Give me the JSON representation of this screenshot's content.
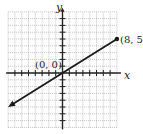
{
  "chart_data": {
    "type": "line",
    "title": "",
    "xlabel": "x",
    "ylabel": "y",
    "xlim": [
      -8,
      8
    ],
    "ylim": [
      -8,
      9
    ],
    "grid": true,
    "series": [
      {
        "name": "line through origin",
        "x": [
          -8,
          0,
          8
        ],
        "y": [
          -5,
          0,
          5
        ],
        "arrow_start": true,
        "endpoint_dot": [
          8,
          5
        ]
      }
    ],
    "annotations": [
      {
        "text": "(0, 0)",
        "x": 0,
        "y": 0
      },
      {
        "text": "(8, 5)",
        "x": 8,
        "y": 5
      }
    ]
  },
  "labels": {
    "x_axis": "x",
    "y_axis": "y",
    "origin": "(0, 0)",
    "endpoint": "(8, 5)"
  },
  "colors": {
    "grid": "#9a9a9a",
    "axis": "#222222",
    "line": "#1a1a1a"
  }
}
